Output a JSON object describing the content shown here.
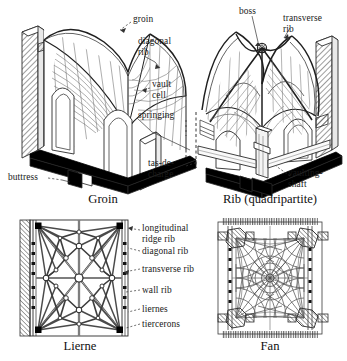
{
  "figure": {
    "kind": "architectural-diagram",
    "panels": [
      {
        "id": "groin",
        "caption": "Groin",
        "caption_pos": {
          "x": 60,
          "y": 194,
          "w": 86
        },
        "labels": [
          {
            "id": "groin-label",
            "text": "groin",
            "x": 133,
            "y": 18,
            "align": "left"
          },
          {
            "id": "diagonal-rib",
            "text": "diagonal\nrib",
            "x": 138,
            "y": 40,
            "align": "left"
          },
          {
            "id": "vault-cell",
            "text": "vault\ncell",
            "x": 152,
            "y": 83,
            "align": "left"
          },
          {
            "id": "springing",
            "text": "springing",
            "x": 140,
            "y": 113,
            "align": "left"
          },
          {
            "id": "buttress",
            "text": "buttress",
            "x": 10,
            "y": 174,
            "align": "left"
          }
        ]
      },
      {
        "id": "rib-quadripartite",
        "caption": "Rib (quadripartite)",
        "caption_pos": {
          "x": 194,
          "y": 194,
          "w": 152
        },
        "labels": [
          {
            "id": "boss",
            "text": "boss",
            "x": 239,
            "y": 9,
            "align": "left"
          },
          {
            "id": "transverse-rib",
            "text": "transverse\nrib",
            "x": 284,
            "y": 16,
            "align": "left"
          },
          {
            "id": "tas-de-charge",
            "text": "tas-de-\ncharge",
            "x": 153,
            "y": 160,
            "align": "left"
          },
          {
            "id": "vaulting-shaft",
            "text": "vaulting-\nshaft",
            "x": 292,
            "y": 170,
            "align": "left"
          }
        ]
      },
      {
        "id": "lierne",
        "caption": "Lierne",
        "caption_pos": {
          "x": 30,
          "y": 341,
          "w": 100
        },
        "labels": []
      },
      {
        "id": "fan",
        "caption": "Fan",
        "caption_pos": {
          "x": 230,
          "y": 341,
          "w": 80
        },
        "labels": []
      }
    ],
    "plan_labels": [
      {
        "id": "longitudinal-ridge-rib",
        "text": "longitudinal\nridge rib",
        "x": 142,
        "y": 226
      },
      {
        "id": "diagonal-rib-plan",
        "text": "diagonal rib",
        "x": 142,
        "y": 249
      },
      {
        "id": "transverse-rib-plan",
        "text": "transverse rib",
        "x": 142,
        "y": 267
      },
      {
        "id": "wall-rib",
        "text": "wall rib",
        "x": 142,
        "y": 288
      },
      {
        "id": "liernes",
        "text": "liernes",
        "x": 142,
        "y": 307
      },
      {
        "id": "tiercerons",
        "text": "tiercerons",
        "x": 142,
        "y": 322
      }
    ],
    "colors": {
      "ink": "#1a1a1a",
      "line": "#2b2b2b",
      "hatch": "#555555",
      "solid_black": "#000000",
      "paper": "#ffffff",
      "light_line": "#777777"
    }
  }
}
